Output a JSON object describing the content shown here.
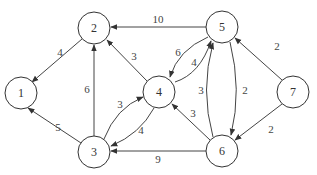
{
  "graph": {
    "type": "directed-weighted",
    "nodes": [
      {
        "id": "1",
        "label": "1",
        "x": 21,
        "y": 93
      },
      {
        "id": "2",
        "label": "2",
        "x": 94,
        "y": 28
      },
      {
        "id": "3",
        "label": "3",
        "x": 94,
        "y": 152
      },
      {
        "id": "4",
        "label": "4",
        "x": 159,
        "y": 92
      },
      {
        "id": "5",
        "label": "5",
        "x": 222,
        "y": 27
      },
      {
        "id": "6",
        "label": "6",
        "x": 222,
        "y": 151
      },
      {
        "id": "7",
        "label": "7",
        "x": 293,
        "y": 92
      }
    ],
    "edges": [
      {
        "from": "2",
        "to": "1",
        "weight": "4"
      },
      {
        "from": "5",
        "to": "2",
        "weight": "10"
      },
      {
        "from": "4",
        "to": "2",
        "weight": "3"
      },
      {
        "from": "3",
        "to": "2",
        "weight": "6"
      },
      {
        "from": "3",
        "to": "1",
        "weight": "5"
      },
      {
        "from": "3",
        "to": "4",
        "weight": "3"
      },
      {
        "from": "4",
        "to": "3",
        "weight": "4"
      },
      {
        "from": "5",
        "to": "4",
        "weight": "6"
      },
      {
        "from": "4",
        "to": "5",
        "weight": "4"
      },
      {
        "from": "6",
        "to": "5",
        "weight": "3"
      },
      {
        "from": "5",
        "to": "6",
        "weight": "2"
      },
      {
        "from": "6",
        "to": "4",
        "weight": "3"
      },
      {
        "from": "6",
        "to": "3",
        "weight": "9"
      },
      {
        "from": "7",
        "to": "5",
        "weight": "2"
      },
      {
        "from": "7",
        "to": "6",
        "weight": "2"
      }
    ]
  }
}
